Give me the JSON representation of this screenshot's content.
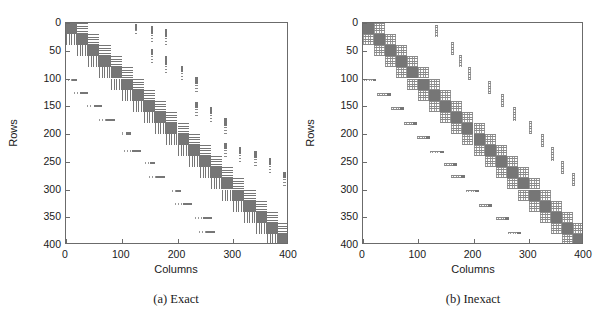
{
  "figure": {
    "panels": [
      {
        "id": "exact",
        "caption": "(a) Exact",
        "xlabel": "Columns",
        "ylabel": "Rows",
        "xticks": [
          "0",
          "100",
          "200",
          "300",
          "400"
        ],
        "yticks": [
          "0",
          "50",
          "100",
          "150",
          "200",
          "250",
          "300",
          "350",
          "400"
        ]
      },
      {
        "id": "inexact",
        "caption": "(b) Inexact",
        "xlabel": "Columns",
        "ylabel": "Rows",
        "xticks": [
          "0",
          "100",
          "200",
          "300",
          "400"
        ],
        "yticks": [
          "0",
          "50",
          "100",
          "150",
          "200",
          "250",
          "300",
          "350",
          "400"
        ]
      }
    ]
  },
  "chart_data": [
    {
      "type": "heatmap",
      "title": "(a) Exact",
      "xlabel": "Columns",
      "ylabel": "Rows",
      "xlim": [
        0,
        400
      ],
      "ylim": [
        400,
        0
      ],
      "xticks": [
        0,
        100,
        200,
        300,
        400
      ],
      "yticks": [
        0,
        50,
        100,
        150,
        200,
        250,
        300,
        350,
        400
      ],
      "grid": false,
      "legend": null,
      "description": "Sparsity pattern of a block matrix: 20 solid diagonal blocks of size 20x20 along the main diagonal, horizontally-striped coupling blocks immediately to the right of each diagonal block, vertically-striped coupling blocks immediately below each diagonal block, plus scattered off-diagonal fill: short horizontal dash marks in the lower-left triangle and short vertical dotted marks in the upper-right triangle.",
      "block_size": 20,
      "n_blocks": 20,
      "diagonal_blocks": [
        {
          "row": 0,
          "col": 0
        },
        {
          "row": 20,
          "col": 20
        },
        {
          "row": 40,
          "col": 40
        },
        {
          "row": 60,
          "col": 60
        },
        {
          "row": 80,
          "col": 80
        },
        {
          "row": 100,
          "col": 100
        },
        {
          "row": 120,
          "col": 120
        },
        {
          "row": 140,
          "col": 140
        },
        {
          "row": 160,
          "col": 160
        },
        {
          "row": 180,
          "col": 180
        },
        {
          "row": 200,
          "col": 200
        },
        {
          "row": 220,
          "col": 220
        },
        {
          "row": 240,
          "col": 240
        },
        {
          "row": 260,
          "col": 260
        },
        {
          "row": 280,
          "col": 280
        },
        {
          "row": 300,
          "col": 300
        },
        {
          "row": 320,
          "col": 320
        },
        {
          "row": 340,
          "col": 340
        },
        {
          "row": 360,
          "col": 360
        },
        {
          "row": 380,
          "col": 380
        }
      ],
      "superdiagonal_blocks": [
        {
          "row": 0,
          "col": 20
        },
        {
          "row": 20,
          "col": 40
        },
        {
          "row": 40,
          "col": 60
        },
        {
          "row": 60,
          "col": 80
        },
        {
          "row": 80,
          "col": 100
        },
        {
          "row": 100,
          "col": 120
        },
        {
          "row": 120,
          "col": 140
        },
        {
          "row": 140,
          "col": 160
        },
        {
          "row": 160,
          "col": 180
        },
        {
          "row": 180,
          "col": 200
        },
        {
          "row": 200,
          "col": 220
        },
        {
          "row": 220,
          "col": 240
        },
        {
          "row": 240,
          "col": 260
        },
        {
          "row": 260,
          "col": 280
        },
        {
          "row": 280,
          "col": 300
        },
        {
          "row": 300,
          "col": 320
        },
        {
          "row": 320,
          "col": 340
        },
        {
          "row": 340,
          "col": 360
        },
        {
          "row": 360,
          "col": 380
        }
      ],
      "subdiagonal_blocks": [
        {
          "row": 20,
          "col": 0
        },
        {
          "row": 40,
          "col": 20
        },
        {
          "row": 60,
          "col": 40
        },
        {
          "row": 80,
          "col": 60
        },
        {
          "row": 100,
          "col": 80
        },
        {
          "row": 120,
          "col": 100
        },
        {
          "row": 140,
          "col": 120
        },
        {
          "row": 160,
          "col": 140
        },
        {
          "row": 180,
          "col": 160
        },
        {
          "row": 200,
          "col": 180
        },
        {
          "row": 220,
          "col": 200
        },
        {
          "row": 240,
          "col": 220
        },
        {
          "row": 260,
          "col": 240
        },
        {
          "row": 280,
          "col": 260
        },
        {
          "row": 300,
          "col": 280
        },
        {
          "row": 320,
          "col": 300
        },
        {
          "row": 340,
          "col": 320
        },
        {
          "row": 360,
          "col": 340
        },
        {
          "row": 380,
          "col": 360
        }
      ],
      "lower_scatter": [
        {
          "row": 100,
          "col": 4,
          "width": 16
        },
        {
          "row": 124,
          "col": 14,
          "width": 26
        },
        {
          "row": 148,
          "col": 38,
          "width": 26
        },
        {
          "row": 173,
          "col": 60,
          "width": 28
        },
        {
          "row": 197,
          "col": 100,
          "width": 16
        },
        {
          "row": 228,
          "col": 104,
          "width": 30
        },
        {
          "row": 250,
          "col": 142,
          "width": 18
        },
        {
          "row": 275,
          "col": 148,
          "width": 30
        },
        {
          "row": 300,
          "col": 190,
          "width": 16
        },
        {
          "row": 324,
          "col": 196,
          "width": 30
        },
        {
          "row": 350,
          "col": 232,
          "width": 30
        },
        {
          "row": 374,
          "col": 238,
          "width": 30
        }
      ],
      "upper_scatter": [
        {
          "col": 124,
          "row": 2,
          "height": 22
        },
        {
          "col": 152,
          "row": 6,
          "height": 30
        },
        {
          "col": 152,
          "row": 46,
          "height": 26
        },
        {
          "col": 178,
          "row": 10,
          "height": 34
        },
        {
          "col": 178,
          "row": 60,
          "height": 34
        },
        {
          "col": 206,
          "row": 78,
          "height": 24
        },
        {
          "col": 232,
          "row": 98,
          "height": 28
        },
        {
          "col": 232,
          "row": 142,
          "height": 26
        },
        {
          "col": 258,
          "row": 152,
          "height": 28
        },
        {
          "col": 284,
          "row": 172,
          "height": 30
        },
        {
          "col": 284,
          "row": 216,
          "height": 26
        },
        {
          "col": 310,
          "row": 224,
          "height": 28
        },
        {
          "col": 338,
          "row": 230,
          "height": 30
        },
        {
          "col": 364,
          "row": 244,
          "height": 28
        },
        {
          "col": 390,
          "row": 268,
          "height": 26
        }
      ]
    },
    {
      "type": "heatmap",
      "title": "(b) Inexact",
      "xlabel": "Columns",
      "ylabel": "Rows",
      "xlim": [
        0,
        400
      ],
      "ylim": [
        400,
        0
      ],
      "xticks": [
        0,
        100,
        200,
        300,
        400
      ],
      "yticks": [
        0,
        50,
        100,
        150,
        200,
        250,
        300,
        350,
        400
      ],
      "grid": false,
      "legend": null,
      "description": "Sparsity pattern of the inexact factorization: 20 solid diagonal blocks of size 20x20 with lighter dotted/fuzzy coupling blocks hugging the diagonal on both sides, and sparser scattered off-diagonal fill — faint horizontal speckle marks in the lower-left triangle and faint vertical speckle marks in the upper-right triangle. The band is noticeably tighter than in (a).",
      "block_size": 20,
      "n_blocks": 20,
      "diagonal_blocks": [
        {
          "row": 0,
          "col": 0
        },
        {
          "row": 20,
          "col": 20
        },
        {
          "row": 40,
          "col": 40
        },
        {
          "row": 60,
          "col": 60
        },
        {
          "row": 80,
          "col": 80
        },
        {
          "row": 100,
          "col": 100
        },
        {
          "row": 120,
          "col": 120
        },
        {
          "row": 140,
          "col": 140
        },
        {
          "row": 160,
          "col": 160
        },
        {
          "row": 180,
          "col": 180
        },
        {
          "row": 200,
          "col": 200
        },
        {
          "row": 220,
          "col": 220
        },
        {
          "row": 240,
          "col": 240
        },
        {
          "row": 260,
          "col": 260
        },
        {
          "row": 280,
          "col": 280
        },
        {
          "row": 300,
          "col": 300
        },
        {
          "row": 320,
          "col": 320
        },
        {
          "row": 340,
          "col": 340
        },
        {
          "row": 360,
          "col": 360
        },
        {
          "row": 380,
          "col": 380
        }
      ],
      "superdiagonal_blocks": [
        {
          "row": 0,
          "col": 20
        },
        {
          "row": 20,
          "col": 40
        },
        {
          "row": 40,
          "col": 60
        },
        {
          "row": 60,
          "col": 80
        },
        {
          "row": 80,
          "col": 100
        },
        {
          "row": 100,
          "col": 120
        },
        {
          "row": 120,
          "col": 140
        },
        {
          "row": 140,
          "col": 160
        },
        {
          "row": 160,
          "col": 180
        },
        {
          "row": 180,
          "col": 200
        },
        {
          "row": 200,
          "col": 220
        },
        {
          "row": 220,
          "col": 240
        },
        {
          "row": 240,
          "col": 260
        },
        {
          "row": 260,
          "col": 280
        },
        {
          "row": 280,
          "col": 300
        },
        {
          "row": 300,
          "col": 320
        },
        {
          "row": 320,
          "col": 340
        },
        {
          "row": 340,
          "col": 360
        },
        {
          "row": 360,
          "col": 380
        }
      ],
      "subdiagonal_blocks": [
        {
          "row": 20,
          "col": 0
        },
        {
          "row": 40,
          "col": 20
        },
        {
          "row": 60,
          "col": 40
        },
        {
          "row": 80,
          "col": 60
        },
        {
          "row": 100,
          "col": 80
        },
        {
          "row": 120,
          "col": 100
        },
        {
          "row": 140,
          "col": 120
        },
        {
          "row": 160,
          "col": 140
        },
        {
          "row": 180,
          "col": 160
        },
        {
          "row": 200,
          "col": 180
        },
        {
          "row": 220,
          "col": 200
        },
        {
          "row": 240,
          "col": 220
        },
        {
          "row": 260,
          "col": 240
        },
        {
          "row": 280,
          "col": 260
        },
        {
          "row": 300,
          "col": 280
        },
        {
          "row": 320,
          "col": 300
        },
        {
          "row": 340,
          "col": 320
        },
        {
          "row": 360,
          "col": 340
        },
        {
          "row": 380,
          "col": 360
        }
      ],
      "lower_scatter": [
        {
          "row": 100,
          "col": 2,
          "width": 22
        },
        {
          "row": 126,
          "col": 26,
          "width": 24
        },
        {
          "row": 152,
          "col": 50,
          "width": 24
        },
        {
          "row": 178,
          "col": 74,
          "width": 24
        },
        {
          "row": 204,
          "col": 98,
          "width": 24
        },
        {
          "row": 230,
          "col": 122,
          "width": 24
        },
        {
          "row": 252,
          "col": 146,
          "width": 24
        },
        {
          "row": 274,
          "col": 160,
          "width": 24
        },
        {
          "row": 300,
          "col": 186,
          "width": 24
        },
        {
          "row": 326,
          "col": 210,
          "width": 24
        },
        {
          "row": 350,
          "col": 240,
          "width": 24
        },
        {
          "row": 376,
          "col": 262,
          "width": 24
        }
      ],
      "upper_scatter": [
        {
          "col": 130,
          "row": 4,
          "height": 22
        },
        {
          "col": 160,
          "row": 34,
          "height": 24
        },
        {
          "col": 174,
          "row": 58,
          "height": 22
        },
        {
          "col": 190,
          "row": 80,
          "height": 22
        },
        {
          "col": 226,
          "row": 104,
          "height": 24
        },
        {
          "col": 250,
          "row": 128,
          "height": 24
        },
        {
          "col": 272,
          "row": 152,
          "height": 24
        },
        {
          "col": 300,
          "row": 176,
          "height": 24
        },
        {
          "col": 322,
          "row": 200,
          "height": 24
        },
        {
          "col": 340,
          "row": 224,
          "height": 24
        },
        {
          "col": 358,
          "row": 248,
          "height": 24
        },
        {
          "col": 378,
          "row": 270,
          "height": 24
        }
      ]
    }
  ]
}
